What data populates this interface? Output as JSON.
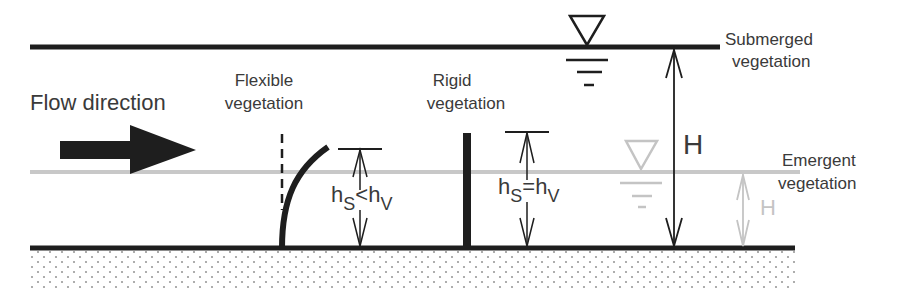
{
  "diagram": {
    "flow_label": "Flow direction",
    "flexible_label_line1": "Flexible",
    "flexible_label_line2": "vegetation",
    "rigid_label_line1": "Rigid",
    "rigid_label_line2": "vegetation",
    "submerged_label_line1": "Submerged",
    "submerged_label_line2": "vegetation",
    "emergent_label_line1": "Emergent",
    "emergent_label_line2": "vegetation",
    "flexible_relation": {
      "h": "h",
      "s": "S",
      "op": "<",
      "h2": "h",
      "v": "V"
    },
    "rigid_relation": {
      "h": "h",
      "s": "S",
      "op": "=",
      "h2": "h",
      "v": "V"
    },
    "depth_label_submerged": "H",
    "depth_label_emergent": "H",
    "colors": {
      "dark": "#1e1e1e",
      "text": "#3a3a3a",
      "light": "#c4c4c4",
      "sediment_dot": "#9a9a9a"
    }
  }
}
